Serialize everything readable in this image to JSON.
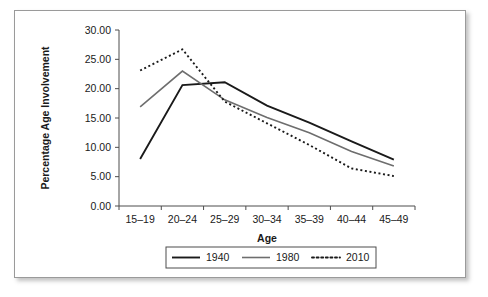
{
  "chart_data": {
    "type": "line",
    "title": "",
    "xlabel": "Age",
    "ylabel": "Percentage Age Involvement",
    "categories": [
      "15–19",
      "20–24",
      "25–29",
      "30–34",
      "35–39",
      "40–44",
      "45–49"
    ],
    "ylim": [
      0,
      30
    ],
    "ytick_values": [
      0,
      5,
      10,
      15,
      20,
      25,
      30
    ],
    "ytick_labels": [
      "0.00",
      "5.00",
      "10.00",
      "15.00",
      "20.00",
      "25.00",
      "30.00"
    ],
    "grid": false,
    "legend_position": "bottom",
    "series": [
      {
        "name": "1940",
        "values": [
          8.0,
          20.6,
          21.1,
          17.1,
          14.2,
          11.0,
          7.9
        ],
        "color": "#1a1a1a",
        "style": "solid",
        "width": 1.9
      },
      {
        "name": "1980",
        "values": [
          16.9,
          23.0,
          18.1,
          15.1,
          12.5,
          9.3,
          6.8
        ],
        "color": "#6e6e6e",
        "style": "solid",
        "width": 1.6
      },
      {
        "name": "2010",
        "values": [
          23.1,
          26.7,
          17.8,
          14.1,
          10.4,
          6.4,
          5.1
        ],
        "color": "#1a1a1a",
        "style": "dotted",
        "width": 1.9
      }
    ]
  },
  "legend": {
    "entries": [
      {
        "label": "1940"
      },
      {
        "label": "1980"
      },
      {
        "label": "2010"
      }
    ]
  }
}
